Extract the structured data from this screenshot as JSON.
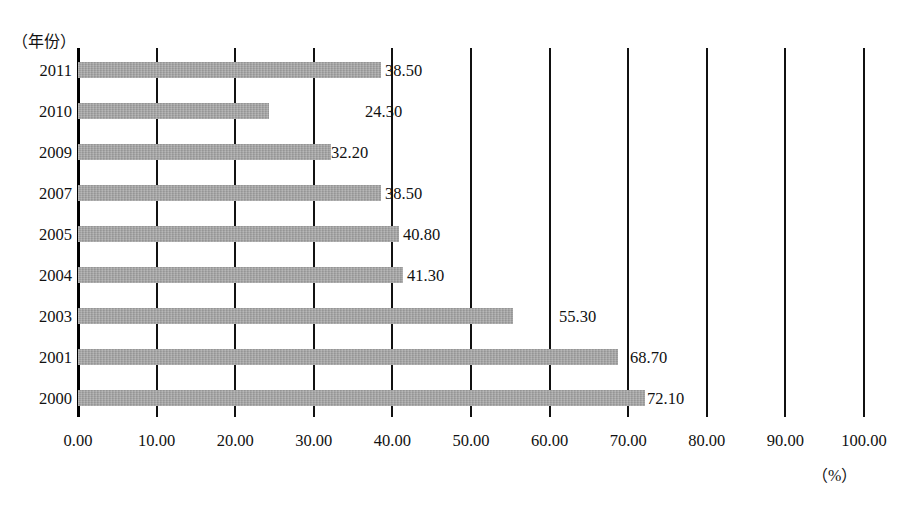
{
  "chart_data": {
    "type": "bar",
    "orientation": "horizontal",
    "title": "",
    "subtitle": "",
    "xlabel": "（%）",
    "ylabel": "（年份）",
    "categories": [
      "2011",
      "2010",
      "2009",
      "2007",
      "2005",
      "2004",
      "2003",
      "2001",
      "2000"
    ],
    "values": [
      38.5,
      24.3,
      32.2,
      38.5,
      40.8,
      41.3,
      55.3,
      68.7,
      72.1
    ],
    "value_labels": [
      "38.50",
      "24.30",
      "32.20",
      "38.50",
      "40.80",
      "41.30",
      "55.30",
      "68.70",
      "72.10"
    ],
    "xlim": [
      0,
      100
    ],
    "xticks": [
      0,
      10,
      20,
      30,
      40,
      50,
      60,
      70,
      80,
      90,
      100
    ],
    "xtick_labels": [
      "0.00",
      "10.00",
      "20.00",
      "30.00",
      "40.00",
      "50.00",
      "60.00",
      "70.00",
      "80.00",
      "90.00",
      "100.00"
    ],
    "grid": true,
    "grid_axis": "x",
    "legend": false,
    "legend_position": "none",
    "bar_color": "#a3a3a3",
    "grid_color": "#111111",
    "axis_color": "#000000",
    "text_color": "#111111",
    "background_color": "#ffffff",
    "label_offsets_px": [
      4,
      96,
      0,
      4,
      4,
      4,
      46,
      12,
      2
    ]
  }
}
